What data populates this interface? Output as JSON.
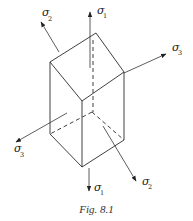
{
  "figure": {
    "caption": "Fig. 8.1",
    "labels": {
      "sigma1_top": {
        "symbol": "σ",
        "sub": "1"
      },
      "sigma2_top": {
        "symbol": "σ",
        "sub": "2"
      },
      "sigma3_right": {
        "symbol": "σ",
        "sub": "3"
      },
      "sigma3_left": {
        "symbol": "σ",
        "sub": "3"
      },
      "sigma1_bottom": {
        "symbol": "σ",
        "sub": "1"
      },
      "sigma2_bottom": {
        "symbol": "σ",
        "sub": "2"
      }
    }
  }
}
